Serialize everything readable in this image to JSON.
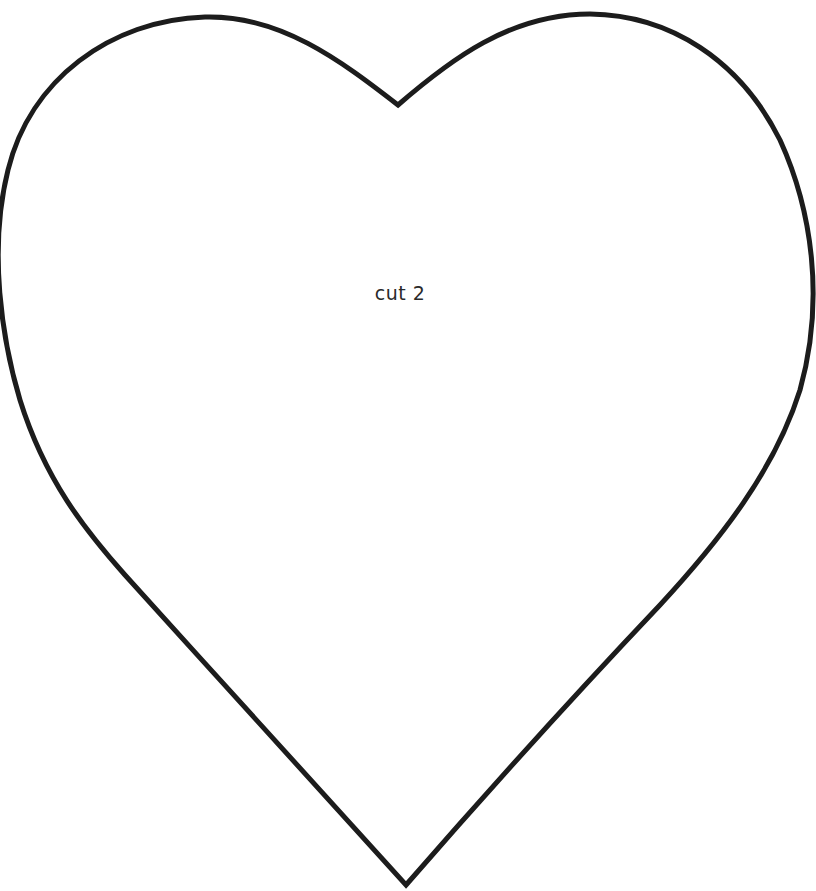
{
  "template": {
    "shape": "heart",
    "instruction_label": "cut 2",
    "stroke_color": "#1c1c1c",
    "background_color": "#ffffff",
    "stroke_width": 5
  }
}
